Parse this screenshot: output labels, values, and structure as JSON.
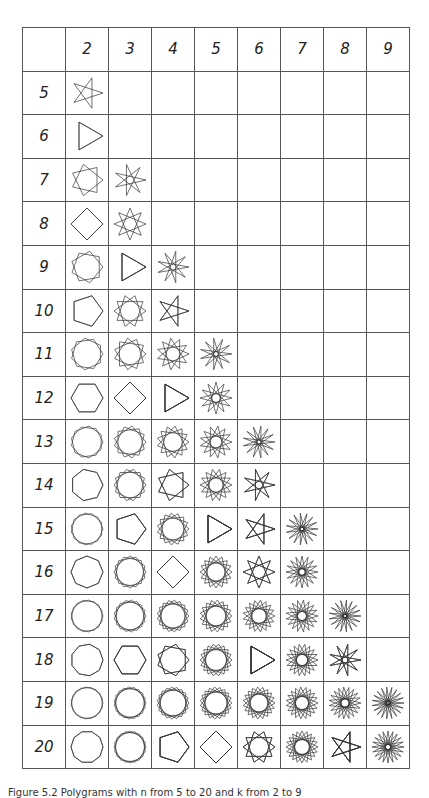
{
  "table": {
    "column_headers": [
      "",
      "2",
      "3",
      "4",
      "5",
      "6",
      "7",
      "8",
      "9"
    ],
    "row_headers": [
      "5",
      "6",
      "7",
      "8",
      "9",
      "10",
      "11",
      "12",
      "13",
      "14",
      "15",
      "16",
      "17",
      "18",
      "19",
      "20"
    ],
    "cell_rule": "polygram {n/k} drawn where k < n/2",
    "line_color": "#333333"
  },
  "caption": "Figure 5.2 Polygrams with n from 5 to 20 and k from 2 to 9"
}
